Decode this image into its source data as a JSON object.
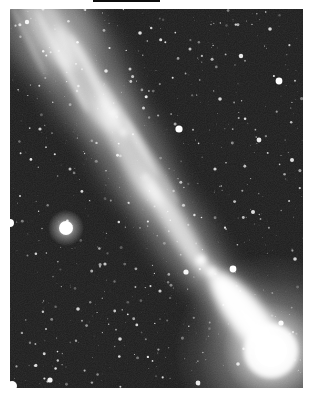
{
  "image": {
    "title": "Black-and-white photograph of a bright comet with a long diffuse tail crossing a dense star field",
    "medium": "monochrome astronomical photograph on white paper",
    "palette": {
      "paper": "#ffffff",
      "sky": "#191919",
      "stars": "#ffffff",
      "comet": "#ffffff",
      "artifact": "#0d0d0d"
    }
  },
  "photo": {
    "frame": {
      "left": 10,
      "top": 9,
      "width": 293,
      "height": 379
    },
    "sky_color": "#191919",
    "artifact_line": {
      "left": 93,
      "top": 0,
      "width": 67,
      "height": 2,
      "color": "#0d0d0d"
    },
    "comet": {
      "head": {
        "x": 261,
        "y": 342,
        "core_radius": 16,
        "inner_glow_radius": 27,
        "glow_radius": 98,
        "fan": {
          "cx": 236,
          "cy": 306,
          "rx": 50,
          "ry": 18,
          "rot": 52,
          "opacity": 0.95
        }
      },
      "tail": {
        "outer": [
          {
            "cx": 226,
            "cy": 298,
            "rx": 62,
            "ry": 20,
            "rot": 52,
            "opacity": 0.5
          },
          {
            "cx": 165,
            "cy": 218,
            "rx": 70,
            "ry": 26,
            "rot": 57,
            "opacity": 0.42
          },
          {
            "cx": 118,
            "cy": 140,
            "rx": 75,
            "ry": 32,
            "rot": 62,
            "opacity": 0.38
          },
          {
            "cx": 70,
            "cy": 60,
            "rx": 80,
            "ry": 40,
            "rot": 62,
            "opacity": 0.34
          },
          {
            "cx": 32,
            "cy": 8,
            "rx": 70,
            "ry": 46,
            "rot": 62,
            "opacity": 0.3
          }
        ],
        "inner": [
          {
            "cx": 228,
            "cy": 297,
            "rx": 55,
            "ry": 9,
            "rot": 52,
            "opacity": 0.85
          },
          {
            "cx": 167,
            "cy": 217,
            "rx": 58,
            "ry": 11,
            "rot": 58,
            "opacity": 0.7
          },
          {
            "cx": 120,
            "cy": 142,
            "rx": 62,
            "ry": 14,
            "rot": 62,
            "opacity": 0.6
          },
          {
            "cx": 75,
            "cy": 70,
            "rx": 60,
            "ry": 16,
            "rot": 62,
            "opacity": 0.52
          },
          {
            "cx": 36,
            "cy": 16,
            "rx": 52,
            "ry": 17,
            "rot": 60,
            "opacity": 0.45
          }
        ],
        "streamers": [
          {
            "cx": 52,
            "cy": 52,
            "rx": 58,
            "ry": 4,
            "rot": 63,
            "opacity": 0.4
          },
          {
            "cx": 88,
            "cy": 78,
            "rx": 60,
            "ry": 4.5,
            "rot": 62,
            "opacity": 0.45
          },
          {
            "cx": 120,
            "cy": 120,
            "rx": 55,
            "ry": 4,
            "rot": 60,
            "opacity": 0.35
          },
          {
            "cx": 18,
            "cy": 30,
            "rx": 42,
            "ry": 3.5,
            "rot": 64,
            "opacity": 0.3
          },
          {
            "cx": 142,
            "cy": 152,
            "rx": 50,
            "ry": 5,
            "rot": 58,
            "opacity": 0.3
          }
        ],
        "knots": [
          {
            "x": 191,
            "y": 251,
            "r": 5,
            "o": 0.95
          },
          {
            "x": 202,
            "y": 263,
            "r": 4,
            "o": 0.9
          },
          {
            "x": 104,
            "y": 104,
            "r": 3,
            "o": 0.8
          },
          {
            "x": 114,
            "y": 123,
            "r": 3,
            "o": 0.7
          },
          {
            "x": 135,
            "y": 168,
            "r": 2.5,
            "o": 0.7
          }
        ]
      }
    },
    "major_stars": [
      {
        "x": 56,
        "y": 219,
        "r": 7,
        "o": 1,
        "fuzzy": true
      },
      {
        "x": 169,
        "y": 120,
        "r": 3.6,
        "o": 1
      },
      {
        "x": 269,
        "y": 72,
        "r": 3.4,
        "o": 1
      },
      {
        "x": 223,
        "y": 260,
        "r": 3.4,
        "o": 1
      },
      {
        "x": 271,
        "y": 314,
        "r": 2.6,
        "o": 0.95
      },
      {
        "x": 231,
        "y": 47,
        "r": 2.2,
        "o": 0.9
      },
      {
        "x": 249,
        "y": 131,
        "r": 2.4,
        "o": 0.9
      },
      {
        "x": 176,
        "y": 263,
        "r": 2.6,
        "o": 0.95
      },
      {
        "x": 0,
        "y": 214,
        "r": 4,
        "o": 1
      },
      {
        "x": 2,
        "y": 377,
        "r": 5,
        "o": 1
      },
      {
        "x": 40,
        "y": 371,
        "r": 2.6,
        "o": 0.95
      },
      {
        "x": 188,
        "y": 374,
        "r": 2.4,
        "o": 0.9
      },
      {
        "x": 17,
        "y": 13,
        "r": 2.2,
        "o": 0.9
      },
      {
        "x": 282,
        "y": 151,
        "r": 2,
        "o": 0.85
      },
      {
        "x": 130,
        "y": 24,
        "r": 1.8,
        "o": 0.85
      },
      {
        "x": 96,
        "y": 62,
        "r": 1.8,
        "o": 0.8
      },
      {
        "x": 210,
        "y": 90,
        "r": 1.8,
        "o": 0.8
      },
      {
        "x": 243,
        "y": 203,
        "r": 2,
        "o": 0.85
      },
      {
        "x": 68,
        "y": 300,
        "r": 1.8,
        "o": 0.8
      },
      {
        "x": 110,
        "y": 330,
        "r": 1.8,
        "o": 0.8
      },
      {
        "x": 150,
        "y": 282,
        "r": 1.6,
        "o": 0.75
      },
      {
        "x": 30,
        "y": 120,
        "r": 1.6,
        "o": 0.75
      },
      {
        "x": 205,
        "y": 160,
        "r": 1.6,
        "o": 0.8
      },
      {
        "x": 285,
        "y": 250,
        "r": 1.8,
        "o": 0.8
      },
      {
        "x": 60,
        "y": 160,
        "r": 1.5,
        "o": 0.7
      },
      {
        "x": 228,
        "y": 355,
        "r": 1.8,
        "o": 0.8
      },
      {
        "x": 95,
        "y": 255,
        "r": 1.6,
        "o": 0.75
      },
      {
        "x": 260,
        "y": 20,
        "r": 1.8,
        "o": 0.8
      },
      {
        "x": 120,
        "y": 60,
        "r": 1.5,
        "o": 0.7
      },
      {
        "x": 180,
        "y": 40,
        "r": 1.5,
        "o": 0.7
      }
    ],
    "background_stars": {
      "count": 720,
      "seed": 1910
    }
  }
}
